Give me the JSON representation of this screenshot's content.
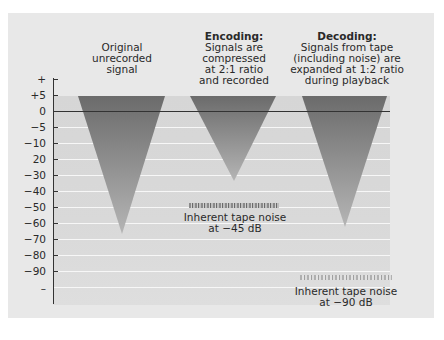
{
  "diagram": {
    "type": "noise-reduction companding diagram",
    "y_axis": {
      "ticks": [
        "+",
        "+5",
        "0",
        "−5",
        "−10",
        "20",
        "−30",
        "−40",
        "−50",
        "−60",
        "−70",
        "−80",
        "−90",
        "–"
      ]
    },
    "columns": [
      {
        "title": "",
        "lines": [
          "Original",
          "unrecorded",
          "signal"
        ],
        "range_db": [
          5,
          -65
        ]
      },
      {
        "title": "Encoding:",
        "lines": [
          "Signals are",
          "compressed",
          "at 2:1 ratio",
          "and recorded"
        ],
        "range_db": [
          5,
          -30
        ]
      },
      {
        "title": "Decoding:",
        "lines": [
          "Signals from tape",
          "(including noise) are",
          "expanded at 1:2 ratio",
          "during playback"
        ],
        "range_db": [
          5,
          -65
        ]
      }
    ],
    "notes": [
      {
        "lines": [
          "Inherent tape noise",
          "at −45 dB"
        ],
        "level_db": -45
      },
      {
        "lines": [
          "Inherent tape noise",
          "at −90 dB"
        ],
        "level_db": -90
      }
    ],
    "colors": {
      "panel": "#e8e8e8",
      "plot": "#d8d8d8",
      "triangle_top": "#6e6e6e",
      "triangle_bottom": "#b8b8b8",
      "axis": "#333333"
    }
  }
}
